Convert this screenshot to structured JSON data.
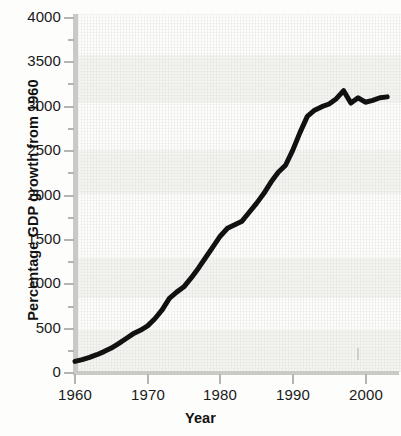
{
  "chart_data": {
    "type": "line",
    "title": "",
    "xlabel": "Year",
    "ylabel": "Percentage GDP growth from 1960",
    "xlim": [
      1959,
      2004
    ],
    "ylim": [
      0,
      4000
    ],
    "grid": false,
    "legend": null,
    "y_major_ticks": [
      0,
      500,
      1000,
      1500,
      2000,
      2500,
      3000,
      3500,
      4000
    ],
    "y_minor_tick_interval": 250,
    "x_major_ticks": [
      1960,
      1970,
      1980,
      1990,
      2000
    ],
    "x_minor_tick_interval": 2,
    "line_color": "#111111",
    "line_width_px": 5,
    "series": [
      {
        "name": "Percentage GDP growth from 1960",
        "x": [
          1960,
          1961,
          1962,
          1963,
          1964,
          1965,
          1966,
          1967,
          1968,
          1969,
          1970,
          1971,
          1972,
          1973,
          1974,
          1975,
          1976,
          1977,
          1978,
          1979,
          1980,
          1981,
          1982,
          1983,
          1984,
          1985,
          1986,
          1987,
          1988,
          1989,
          1990,
          1991,
          1992,
          1993,
          1994,
          1995,
          1996,
          1997,
          1998,
          1999,
          2000,
          2001,
          2002,
          2003
        ],
        "values": [
          120,
          140,
          165,
          195,
          230,
          270,
          320,
          375,
          430,
          470,
          520,
          600,
          700,
          830,
          900,
          960,
          1060,
          1170,
          1290,
          1410,
          1530,
          1620,
          1660,
          1700,
          1800,
          1900,
          2010,
          2140,
          2250,
          2330,
          2500,
          2700,
          2880,
          2950,
          2990,
          3020,
          3080,
          3170,
          3030,
          3090,
          3040,
          3060,
          3090,
          3100
        ]
      }
    ]
  },
  "axis": {
    "y_tick_labels": [
      "4000",
      "3500",
      "3000",
      "2500",
      "2000",
      "1500",
      "1000",
      "500",
      "0"
    ],
    "x_tick_labels": [
      "1960",
      "1970",
      "1980",
      "1990",
      "2000"
    ],
    "x_title": "Year",
    "y_title": "Percentage GDP growth from 1960"
  }
}
